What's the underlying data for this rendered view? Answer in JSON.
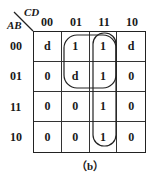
{
  "kmap": {
    "corner": {
      "col_var": "CD",
      "row_var": "AB"
    },
    "col_headers": [
      "00",
      "01",
      "11",
      "10"
    ],
    "row_headers": [
      "00",
      "01",
      "11",
      "10"
    ],
    "cells": [
      [
        "d",
        "1",
        "1",
        "d"
      ],
      [
        "0",
        "d",
        "1",
        "0"
      ],
      [
        "0",
        "0",
        "1",
        "0"
      ],
      [
        "0",
        "0",
        "1",
        "0"
      ]
    ],
    "groupings": [
      {
        "description": "2x2 square loop over rows 00-01, columns 01-11",
        "cells": [
          "00-01",
          "00-11",
          "01-01",
          "01-11"
        ]
      },
      {
        "description": "vertical loop over column 11, all four rows",
        "cells": [
          "00-11",
          "01-11",
          "11-11",
          "10-11"
        ]
      }
    ]
  },
  "caption": "（b）"
}
